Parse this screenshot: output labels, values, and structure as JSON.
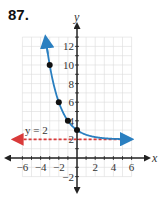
{
  "problem": {
    "number": "87."
  },
  "chart_data": {
    "type": "line",
    "title": "",
    "xlabel": "x",
    "ylabel": "y",
    "xlim": [
      -6,
      6
    ],
    "ylim": [
      -2,
      13
    ],
    "grid": true,
    "x_ticks": [
      -6,
      -4,
      -2,
      2,
      4,
      6
    ],
    "x_tick_labels": [
      "−6",
      "−4",
      "−2",
      "2",
      "4",
      "6"
    ],
    "y_ticks": [
      -2,
      2,
      4,
      6,
      8,
      10,
      12
    ],
    "y_tick_labels": [
      "−2",
      "2",
      "4",
      "6",
      "8",
      "10",
      "12"
    ],
    "series": [
      {
        "name": "y = 2^(-x) + 2",
        "color": "#2a7fc0",
        "points": [
          {
            "x": -3,
            "y": 10
          },
          {
            "x": -2,
            "y": 6
          },
          {
            "x": -1,
            "y": 4
          },
          {
            "x": 0,
            "y": 3
          }
        ],
        "arrows": "both"
      }
    ],
    "annotations": [
      {
        "text": "y = 2",
        "type": "asymptote",
        "y": 2,
        "color": "#d93a3a",
        "style": "dashed"
      }
    ]
  }
}
